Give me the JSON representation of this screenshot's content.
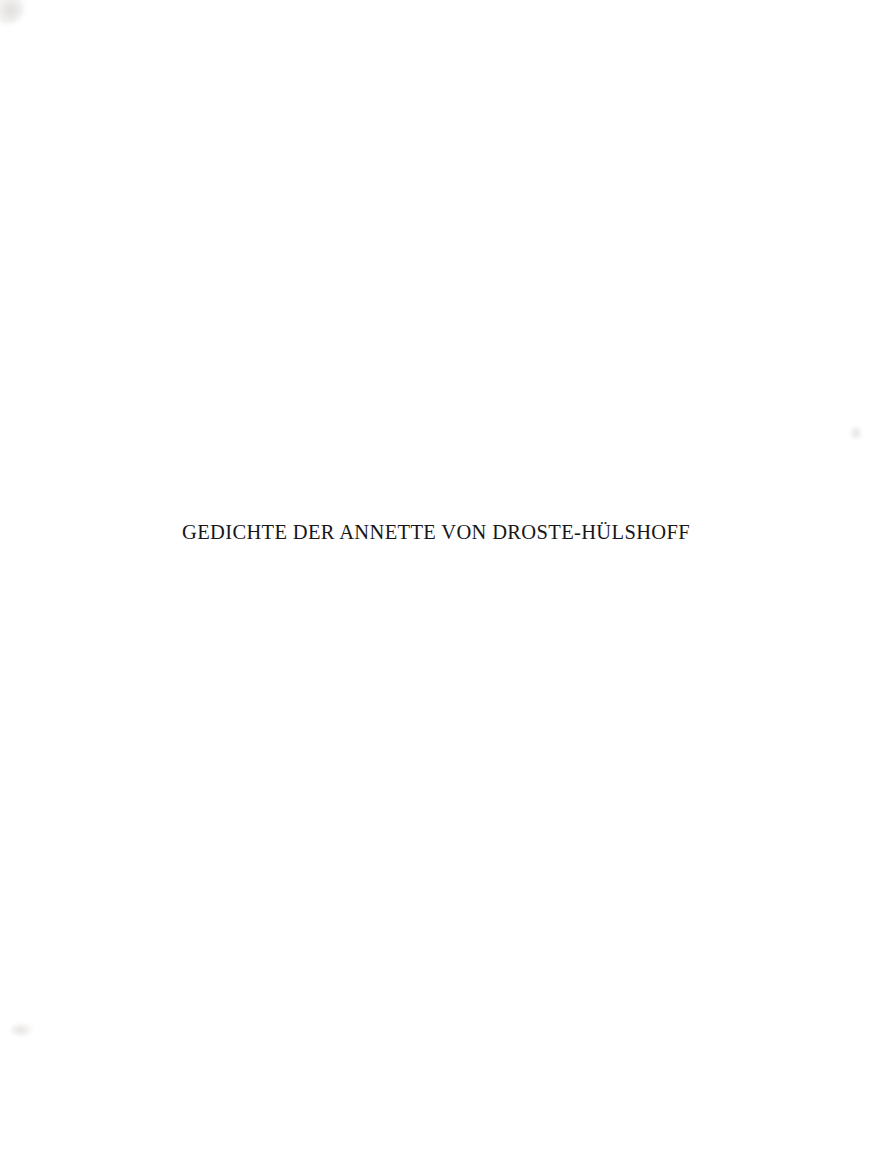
{
  "page": {
    "kind": "scanned-book-half-title-page",
    "width": 872,
    "height": 1175,
    "background_color": "#ffffff",
    "ink_color": "#17171a"
  },
  "title": {
    "text": "GEDICHTE DER ANNETTE VON DROSTE-HÜLSHOFF",
    "transform": "uppercase",
    "alignment": "center"
  },
  "artifacts": {
    "top_left_smudge": "#f2f0ee",
    "right_edge_mark": "#e8e6e4",
    "bottom_left_mark": "#eceae8"
  }
}
